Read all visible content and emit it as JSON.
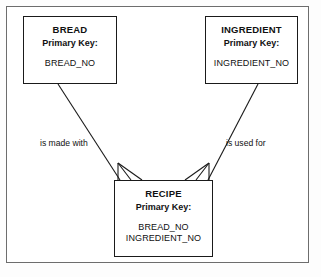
{
  "diagram": {
    "type": "entity-relationship-diagram",
    "entities": [
      {
        "id": "bread",
        "name": "BREAD",
        "pk_label": "Primary Key:",
        "attributes": [
          "BREAD_NO"
        ]
      },
      {
        "id": "ingredient",
        "name": "INGREDIENT",
        "pk_label": "Primary Key:",
        "attributes": [
          "INGREDIENT_NO"
        ]
      },
      {
        "id": "recipe",
        "name": "RECIPE",
        "pk_label": "Primary Key:",
        "attributes": [
          "BREAD_NO",
          "INGREDIENT_NO"
        ]
      }
    ],
    "relationships": [
      {
        "id": "bread-recipe",
        "label": "is made with",
        "from": "BREAD",
        "to": "RECIPE",
        "cardinality": "one-to-many"
      },
      {
        "id": "ingredient-recipe",
        "label": "is used for",
        "from": "INGREDIENT",
        "to": "RECIPE",
        "cardinality": "one-to-many"
      }
    ],
    "colors": {
      "line": "#1a1a1a",
      "frame": "#6d6d6d",
      "background": "#ffffff",
      "text": "#111111"
    }
  }
}
